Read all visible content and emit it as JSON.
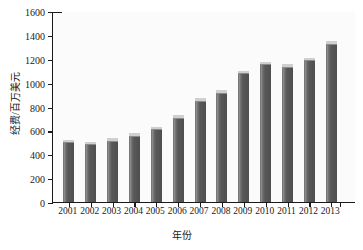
{
  "chart_data": {
    "type": "bar",
    "title": "",
    "xlabel": "年份",
    "ylabel": "经费/百万美元",
    "categories": [
      "2001",
      "2002",
      "2003",
      "2004",
      "2005",
      "2006",
      "2007",
      "2008",
      "2009",
      "2010",
      "2011",
      "2012",
      "2013"
    ],
    "values": [
      520,
      505,
      535,
      575,
      630,
      725,
      870,
      935,
      1100,
      1175,
      1155,
      1210,
      1345
    ],
    "ylim": [
      0,
      1600
    ],
    "yticks": [
      0,
      200,
      400,
      600,
      800,
      1000,
      1200,
      1400,
      1600
    ],
    "ytick_labels": [
      "0",
      "200",
      "400",
      "600",
      "800",
      "1000",
      "1200",
      "1400",
      "1600"
    ],
    "grid": false,
    "legend": null,
    "series_color": "#595959",
    "axis_color": "#1a1a1a",
    "background": "#fbfbfb"
  }
}
